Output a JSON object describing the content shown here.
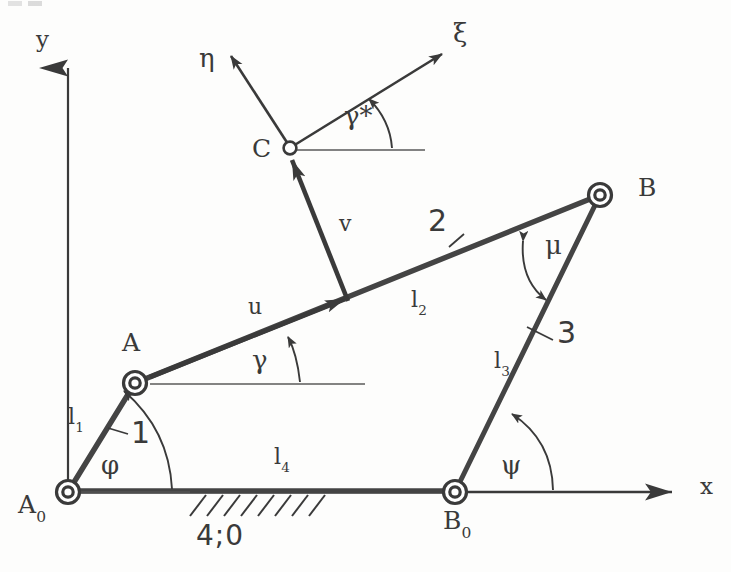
{
  "figure": {
    "stroke_color": "#3a3a3a",
    "thick_stroke_color": "#444444",
    "background": "#fdfdfc"
  },
  "axes": {
    "y_label": "y",
    "x_label": "x",
    "origin_point": "A0"
  },
  "points": [
    {
      "id": "A0",
      "base": "A",
      "sub": "0",
      "x": 68,
      "y": 492,
      "joint": "fixed-pivot"
    },
    {
      "id": "A",
      "base": "A",
      "sub": "",
      "x": 135,
      "y": 383,
      "joint": "moving-pivot"
    },
    {
      "id": "B",
      "base": "B",
      "sub": "",
      "x": 600,
      "y": 195,
      "joint": "moving-pivot"
    },
    {
      "id": "B0",
      "base": "B",
      "sub": "0",
      "x": 455,
      "y": 492,
      "joint": "fixed-pivot"
    },
    {
      "id": "C",
      "base": "C",
      "sub": "",
      "x": 290,
      "y": 148,
      "joint": "coupler-point"
    }
  ],
  "links": [
    {
      "number": "1",
      "length_label": "l",
      "length_sub": "1",
      "from": "A0",
      "to": "A"
    },
    {
      "number": "2",
      "length_label": "l",
      "length_sub": "2",
      "from": "A",
      "to": "B"
    },
    {
      "number": "3",
      "length_label": "l",
      "length_sub": "3",
      "from": "B0",
      "to": "B"
    },
    {
      "number": "4",
      "length_label": "l",
      "length_sub": "4",
      "from": "A0",
      "to": "B0"
    }
  ],
  "ground": {
    "label": "4;0",
    "hatch_from_x": 188,
    "hatch_to_x": 322,
    "line_y": 492
  },
  "angles": [
    {
      "name": "phi",
      "glyph": "φ",
      "at": "A0",
      "between": "x-axis and link 1"
    },
    {
      "name": "gamma",
      "glyph": "γ",
      "at": "A",
      "between": "x-direction and link 2"
    },
    {
      "name": "mu",
      "glyph": "μ",
      "at": "B",
      "between": "link 2 and link 3"
    },
    {
      "name": "psi",
      "glyph": "ψ",
      "at": "B0",
      "between": "x-axis and link 3"
    },
    {
      "name": "gamma_star",
      "glyph": "γ*",
      "at": "C",
      "between": "x-direction and xi-axis"
    }
  ],
  "coupler_frame": {
    "origin": "C",
    "xi_label": "ξ",
    "eta_label": "η",
    "u_label": "u",
    "v_label": "v"
  },
  "vectors": [
    {
      "name": "u",
      "label": "u",
      "description": "along link 2 from A toward foot of v"
    },
    {
      "name": "v",
      "label": "v",
      "description": "from link 2 up to coupler point C"
    },
    {
      "name": "xi",
      "label": "ξ",
      "description": "coupler frame abscissa at C"
    },
    {
      "name": "eta",
      "label": "η",
      "description": "coupler frame ordinate at C"
    }
  ]
}
